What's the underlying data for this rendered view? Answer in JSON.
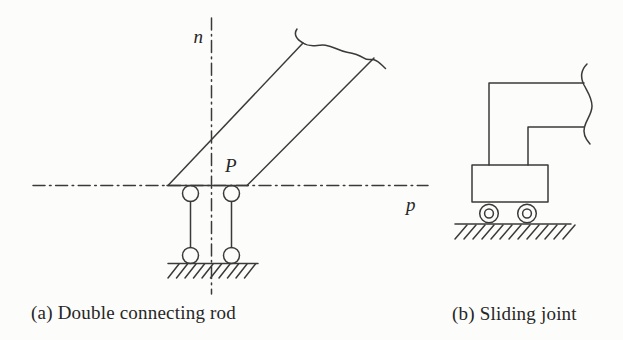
{
  "page": {
    "background": "#fcfcfa",
    "ink_color": "#3a3a3a",
    "text_color": "#262626"
  },
  "diagram_a": {
    "caption": "(a) Double connecting rod",
    "labels": {
      "vertical_axis": "n",
      "horizontal_axis": "p",
      "point": "P"
    }
  },
  "diagram_b": {
    "caption": "(b) Sliding joint"
  }
}
